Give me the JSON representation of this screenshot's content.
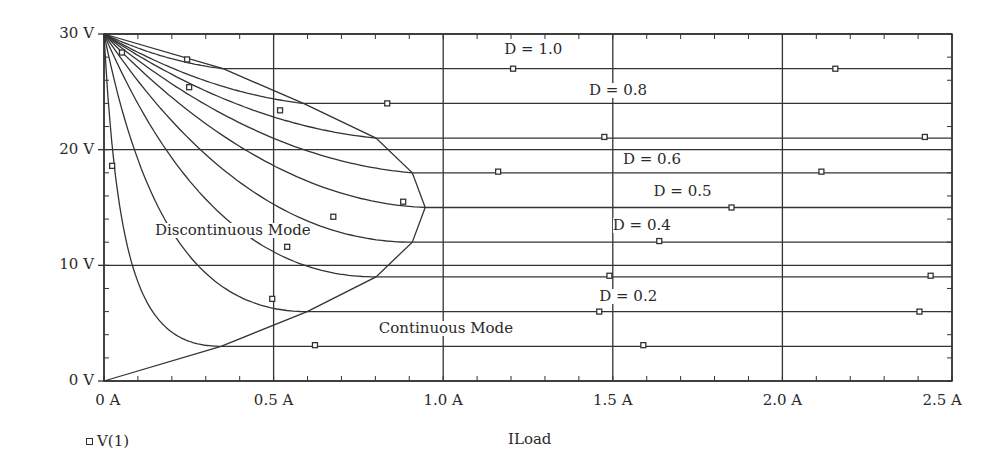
{
  "chart_data": {
    "type": "line",
    "title": "",
    "xlabel": "ILoad",
    "ylabel": "",
    "xlim": [
      0,
      2.5
    ],
    "ylim": [
      0,
      30
    ],
    "x_ticks": [
      {
        "value": 0,
        "label": "0 A"
      },
      {
        "value": 0.5,
        "label": "0.5 A"
      },
      {
        "value": 1.0,
        "label": "1.0 A"
      },
      {
        "value": 1.5,
        "label": "1.5 A"
      },
      {
        "value": 2.0,
        "label": "2.0 A"
      },
      {
        "value": 2.5,
        "label": "2.5 A"
      }
    ],
    "y_ticks": [
      {
        "value": 0,
        "label": "0 V"
      },
      {
        "value": 10,
        "label": "10 V"
      },
      {
        "value": 20,
        "label": "20 V"
      },
      {
        "value": 30,
        "label": "30 V"
      }
    ],
    "x_minor_step": 0.1,
    "y_minor_step": 2,
    "grid": true,
    "legend": {
      "position": "bottom-left",
      "entries": [
        {
          "marker": "square",
          "label": "V(1)"
        }
      ]
    },
    "series": [
      {
        "name": "D = 0.1",
        "duty": 0.1,
        "ccm_voltage": 3,
        "boundary_current": 0.345,
        "dcm_decay": 5.0
      },
      {
        "name": "D = 0.2",
        "duty": 0.2,
        "ccm_voltage": 6,
        "boundary_current": 0.599,
        "dcm_decay": 1.6
      },
      {
        "name": "D = 0.3",
        "duty": 0.3,
        "ccm_voltage": 9,
        "boundary_current": 0.802,
        "dcm_decay": 0.6
      },
      {
        "name": "D = 0.4",
        "duty": 0.4,
        "ccm_voltage": 12,
        "boundary_current": 0.909,
        "dcm_decay": 0.2
      },
      {
        "name": "D = 0.5",
        "duty": 0.5,
        "ccm_voltage": 15,
        "boundary_current": 0.947,
        "dcm_decay": -0.1
      },
      {
        "name": "D = 0.6",
        "duty": 0.6,
        "ccm_voltage": 18,
        "boundary_current": 0.909,
        "dcm_decay": -0.25
      },
      {
        "name": "D = 0.7",
        "duty": 0.7,
        "ccm_voltage": 21,
        "boundary_current": 0.802,
        "dcm_decay": -0.35
      },
      {
        "name": "D = 0.8",
        "duty": 0.8,
        "ccm_voltage": 24,
        "boundary_current": 0.588,
        "dcm_decay": -0.45
      },
      {
        "name": "D = 0.9",
        "duty": 0.9,
        "ccm_voltage": 27,
        "boundary_current": 0.351,
        "dcm_decay": -0.55
      },
      {
        "name": "D = 1.0",
        "duty": 1.0,
        "ccm_voltage": 30,
        "boundary_current": 0,
        "dcm_decay": 0
      }
    ],
    "boundary_curve": [
      [
        0,
        30
      ],
      [
        0.351,
        27
      ],
      [
        0.588,
        24
      ],
      [
        0.802,
        21
      ],
      [
        0.909,
        18
      ],
      [
        0.947,
        15
      ],
      [
        0.909,
        12
      ],
      [
        0.802,
        9
      ],
      [
        0.599,
        6
      ],
      [
        0.345,
        3
      ],
      [
        0,
        0
      ]
    ],
    "markers": [
      [
        0.053,
        28.4
      ],
      [
        0.245,
        27.8
      ],
      [
        0.251,
        25.4
      ],
      [
        0.519,
        23.4
      ],
      [
        0.835,
        24.0
      ],
      [
        0.882,
        15.5
      ],
      [
        0.676,
        14.2
      ],
      [
        0.54,
        11.6
      ],
      [
        0.496,
        7.1
      ],
      [
        0.024,
        18.6
      ],
      [
        0.622,
        3.1
      ],
      [
        1.206,
        27.0
      ],
      [
        2.156,
        27.0
      ],
      [
        1.475,
        21.1
      ],
      [
        2.42,
        21.1
      ],
      [
        1.162,
        18.1
      ],
      [
        2.115,
        18.1
      ],
      [
        1.85,
        15.0
      ],
      [
        1.637,
        12.1
      ],
      [
        1.49,
        9.1
      ],
      [
        2.437,
        9.1
      ],
      [
        1.46,
        6.0
      ],
      [
        2.404,
        6.0
      ],
      [
        1.59,
        3.1
      ]
    ],
    "annotations": [
      {
        "text": "D = 1.0",
        "x": 1.18,
        "y": 28.6
      },
      {
        "text": "D = 0.8",
        "x": 1.43,
        "y": 25.1
      },
      {
        "text": "D = 0.6",
        "x": 1.53,
        "y": 19.1
      },
      {
        "text": "D = 0.5",
        "x": 1.62,
        "y": 16.3
      },
      {
        "text": "D = 0.4",
        "x": 1.5,
        "y": 13.4
      },
      {
        "text": "D = 0.2",
        "x": 1.46,
        "y": 7.3
      },
      {
        "text": "Discontinuous Mode",
        "x": 0.15,
        "y": 13.0
      },
      {
        "text": "Continuous Mode",
        "x": 0.81,
        "y": 4.5
      }
    ]
  },
  "plot_area": {
    "left": 104,
    "right": 952,
    "top": 34,
    "bottom": 381
  }
}
